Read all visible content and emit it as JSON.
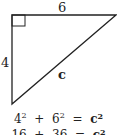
{
  "diagram": {
    "type": "right-triangle",
    "side_top": "6",
    "side_left": "4",
    "hypotenuse": "c",
    "right_angle_marker": true,
    "stroke_color": "#222222"
  },
  "equations": [
    {
      "a": "4",
      "a_exp": "2",
      "op1": "+",
      "b": "6",
      "b_exp": "2",
      "op2": "=",
      "c": "c",
      "c_exp": "2"
    },
    {
      "a": "16",
      "op1": "+",
      "b": "36",
      "op2": "=",
      "c": "c",
      "c_exp": "2"
    }
  ]
}
